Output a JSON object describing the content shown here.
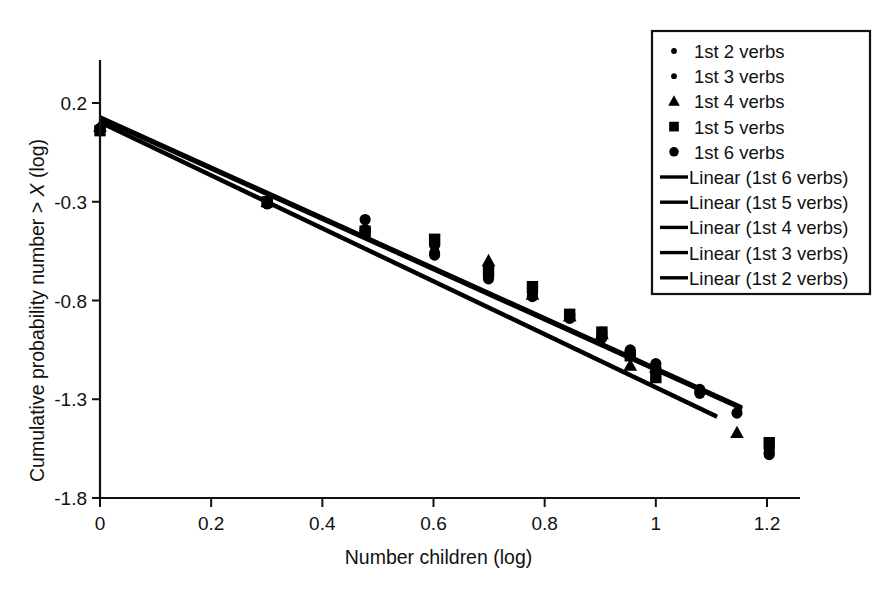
{
  "chart_data": {
    "type": "scatter",
    "title": "",
    "xlabel": "Number children (log)",
    "ylabel_parts": {
      "pre": "Cumulative probability number > ",
      "italic": "X",
      "post": " (log)"
    },
    "ylabel": "Cumulative probability number > X (log)",
    "xlim": [
      0,
      1.3
    ],
    "ylim": [
      -1.8,
      0.45
    ],
    "xticks": [
      "0",
      "0.2",
      "0.4",
      "0.6",
      "0.8",
      "1",
      "1.2"
    ],
    "xtick_values": [
      0,
      0.2,
      0.4,
      0.6,
      0.8,
      1.0,
      1.2
    ],
    "yticks": [
      "0.2",
      "-0.3",
      "-0.8",
      "-1.3",
      "-1.8"
    ],
    "ytick_values": [
      0.2,
      -0.3,
      -0.8,
      -1.3,
      -1.8
    ],
    "grid": false,
    "legend_position": "top-right",
    "marker_color": "#000000",
    "line_color": "#000000",
    "series": [
      {
        "name": "1st 2 verbs",
        "marker": "circle",
        "points": [
          {
            "x": 0.0,
            "y": 0.07
          },
          {
            "x": 0.301,
            "y": -0.31
          },
          {
            "x": 0.477,
            "y": -0.39
          },
          {
            "x": 0.602,
            "y": -0.57
          },
          {
            "x": 0.699,
            "y": -0.63
          },
          {
            "x": 0.778,
            "y": -0.76
          },
          {
            "x": 0.845,
            "y": -0.87
          },
          {
            "x": 0.903,
            "y": -0.96
          },
          {
            "x": 0.954,
            "y": -1.05
          },
          {
            "x": 1.0,
            "y": -1.12
          },
          {
            "x": 1.079,
            "y": -1.27
          },
          {
            "x": 1.146,
            "y": -1.37
          },
          {
            "x": 1.204,
            "y": -1.57
          }
        ]
      },
      {
        "name": "1st 3 verbs",
        "marker": "circle",
        "points": [
          {
            "x": 0.0,
            "y": 0.07
          },
          {
            "x": 0.301,
            "y": -0.31
          },
          {
            "x": 0.477,
            "y": -0.45
          },
          {
            "x": 0.602,
            "y": -0.52
          },
          {
            "x": 0.699,
            "y": -0.68
          },
          {
            "x": 0.778,
            "y": -0.76
          },
          {
            "x": 0.845,
            "y": -0.89
          },
          {
            "x": 0.903,
            "y": -0.98
          },
          {
            "x": 0.954,
            "y": -1.06
          },
          {
            "x": 1.0,
            "y": -1.14
          },
          {
            "x": 1.079,
            "y": -1.25
          },
          {
            "x": 1.204,
            "y": -1.55
          }
        ]
      },
      {
        "name": "1st 4 verbs",
        "marker": "triangle",
        "points": [
          {
            "x": 0.0,
            "y": 0.08
          },
          {
            "x": 0.301,
            "y": -0.3
          },
          {
            "x": 0.699,
            "y": -0.6
          },
          {
            "x": 0.778,
            "y": -0.77
          },
          {
            "x": 0.845,
            "y": -0.88
          },
          {
            "x": 0.903,
            "y": -0.97
          },
          {
            "x": 0.954,
            "y": -1.13
          },
          {
            "x": 1.0,
            "y": -1.14
          },
          {
            "x": 1.146,
            "y": -1.47
          }
        ]
      },
      {
        "name": "1st 5 verbs",
        "marker": "square",
        "points": [
          {
            "x": 0.0,
            "y": 0.06
          },
          {
            "x": 0.301,
            "y": -0.3
          },
          {
            "x": 0.477,
            "y": -0.45
          },
          {
            "x": 0.602,
            "y": -0.49
          },
          {
            "x": 0.699,
            "y": -0.65
          },
          {
            "x": 0.778,
            "y": -0.73
          },
          {
            "x": 0.845,
            "y": -0.87
          },
          {
            "x": 0.903,
            "y": -0.96
          },
          {
            "x": 0.954,
            "y": -1.08
          },
          {
            "x": 1.0,
            "y": -1.19
          },
          {
            "x": 1.204,
            "y": -1.52
          }
        ]
      },
      {
        "name": "1st 6 verbs",
        "marker": "circle",
        "points": [
          {
            "x": 0.0,
            "y": 0.07
          },
          {
            "x": 0.301,
            "y": -0.31
          },
          {
            "x": 0.477,
            "y": -0.44
          },
          {
            "x": 0.602,
            "y": -0.56
          },
          {
            "x": 0.699,
            "y": -0.69
          },
          {
            "x": 0.778,
            "y": -0.78
          },
          {
            "x": 0.845,
            "y": -0.88
          },
          {
            "x": 0.903,
            "y": -0.99
          },
          {
            "x": 0.954,
            "y": -1.07
          },
          {
            "x": 1.0,
            "y": -1.15
          },
          {
            "x": 1.204,
            "y": -1.58
          }
        ]
      }
    ],
    "fit_lines": [
      {
        "name": "Linear (1st 6 verbs)",
        "x0": 0.0,
        "y0": 0.12,
        "x1": 1.155,
        "y1": -1.35
      },
      {
        "name": "Linear (1st 5 verbs)",
        "x0": 0.0,
        "y0": 0.13,
        "x1": 1.155,
        "y1": -1.34
      },
      {
        "name": "Linear (1st 4 verbs)",
        "x0": 0.0,
        "y0": 0.125,
        "x1": 1.155,
        "y1": -1.345
      },
      {
        "name": "Linear (1st 3 verbs)",
        "x0": 0.0,
        "y0": 0.105,
        "x1": 1.11,
        "y1": -1.385
      },
      {
        "name": "Linear (1st 2 verbs)",
        "x0": 0.0,
        "y0": 0.1,
        "x1": 1.11,
        "y1": -1.39
      }
    ],
    "legend": [
      {
        "label": "1st 2 verbs",
        "type": "marker",
        "marker": "circle-small"
      },
      {
        "label": "1st 3 verbs",
        "type": "marker",
        "marker": "circle-small"
      },
      {
        "label": "1st 4 verbs",
        "type": "marker",
        "marker": "triangle"
      },
      {
        "label": "1st 5 verbs",
        "type": "marker",
        "marker": "square"
      },
      {
        "label": "1st 6 verbs",
        "type": "marker",
        "marker": "circle"
      },
      {
        "label": "Linear (1st 6 verbs)",
        "type": "line"
      },
      {
        "label": "Linear (1st 5 verbs)",
        "type": "line"
      },
      {
        "label": "Linear (1st 4 verbs)",
        "type": "line"
      },
      {
        "label": "Linear (1st 3 verbs)",
        "type": "line"
      },
      {
        "label": "Linear (1st 2 verbs)",
        "type": "line"
      }
    ]
  }
}
